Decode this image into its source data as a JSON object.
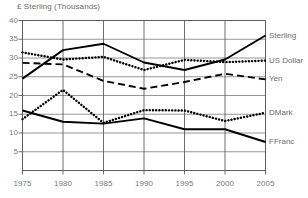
{
  "chart_data": {
    "type": "line",
    "title": "£ Sterling (Thousands)",
    "xlabel": "",
    "ylabel": "£ Sterling (Thousands)",
    "x": [
      1975,
      1980,
      1985,
      1990,
      1995,
      2000,
      2005
    ],
    "xticklabels": [
      "1975",
      "1980",
      "1985",
      "1990",
      "1995",
      "2000",
      "2005"
    ],
    "yticklabels": [
      "40",
      "35",
      "30",
      "25",
      "20",
      "15",
      "10",
      "5"
    ],
    "yticks": [
      40,
      35,
      30,
      25,
      20,
      15,
      10,
      5
    ],
    "xlim": [
      1975,
      2005
    ],
    "ylim": [
      0,
      40
    ],
    "grid": true,
    "legend_position": "right-of-axes",
    "series": [
      {
        "name": "Sterling",
        "label": "Sterling",
        "style": "solid",
        "color": "#000000",
        "values": [
          24.5,
          32.1,
          33.8,
          28.8,
          26.8,
          29.6,
          36.0
        ]
      },
      {
        "name": "US Dollar",
        "label": "US Dollar",
        "style": "dotted",
        "color": "#000000",
        "values": [
          31.5,
          29.6,
          30.3,
          26.8,
          29.5,
          28.9,
          29.3
        ]
      },
      {
        "name": "Yen",
        "label": "Yen",
        "style": "dashed",
        "color": "#000000",
        "values": [
          28.7,
          28.3,
          23.9,
          21.8,
          23.6,
          25.8,
          24.3
        ]
      },
      {
        "name": "DMark",
        "label": "DMark",
        "style": "dotted",
        "color": "#000000",
        "values": [
          13.7,
          21.5,
          12.7,
          16.1,
          16.0,
          13.2,
          15.4
        ]
      },
      {
        "name": "FFranc",
        "label": "FFranc",
        "style": "solid",
        "color": "#000000",
        "values": [
          16.0,
          13.0,
          12.5,
          13.9,
          11.0,
          11.0,
          7.6
        ]
      }
    ]
  },
  "colors": {
    "ink": "#000000",
    "grid": "#8a8a8a",
    "frame": "#5d5d5d",
    "text": "#6e6e6e",
    "background": "#ffffff"
  }
}
